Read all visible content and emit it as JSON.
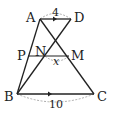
{
  "figure": {
    "type": "trapezoid-geometry",
    "points": {
      "A": {
        "label": "A",
        "x": 40,
        "y": 19
      },
      "D": {
        "label": "D",
        "x": 71,
        "y": 19
      },
      "B": {
        "label": "B",
        "x": 17,
        "y": 94
      },
      "C": {
        "label": "C",
        "x": 94,
        "y": 94
      },
      "P": {
        "label": "P",
        "x": 28,
        "y": 56
      },
      "M": {
        "label": "M",
        "x": 69,
        "y": 56
      },
      "N": {
        "label": "N",
        "x": 45,
        "y": 56
      }
    },
    "measures": {
      "AD": "4",
      "BC": "10",
      "NM": "x"
    },
    "colors": {
      "stroke": "#222222",
      "dashed": "#888888"
    }
  }
}
